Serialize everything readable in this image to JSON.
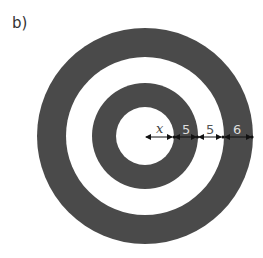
{
  "figure": {
    "label": "b)",
    "colors": {
      "dark": "#4a4a4a",
      "light": "#ffffff",
      "arrow": "#111111"
    },
    "center": {
      "x": 145,
      "y": 137
    },
    "rings_from_center": [
      {
        "name": "inner-white-disc",
        "color": "light",
        "width_label": "x"
      },
      {
        "name": "inner-dark-ring",
        "color": "dark",
        "width_label": "5"
      },
      {
        "name": "middle-white-ring",
        "color": "light",
        "width_label": "5"
      },
      {
        "name": "outer-dark-ring",
        "color": "dark",
        "width_label": "6"
      }
    ],
    "dimension_labels": [
      "x",
      "5",
      "5",
      "6"
    ]
  }
}
